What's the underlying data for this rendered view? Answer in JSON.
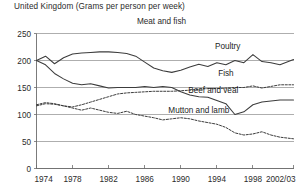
{
  "header": {
    "note": "United Kingdom (Grams per person per week)"
  },
  "chart_data": {
    "type": "line",
    "title": "Meat and fish",
    "subtitle": "United Kingdom (Grams per person per week)",
    "xlabel": "",
    "ylabel": "",
    "ylim": [
      0,
      250
    ],
    "yticks": [
      0,
      50,
      100,
      150,
      200,
      250
    ],
    "ytick_labels": [
      "0",
      "50",
      "100",
      "150",
      "200",
      "250"
    ],
    "xlim": [
      1974,
      2002.5
    ],
    "xticks": [
      1974,
      1978,
      1982,
      1986,
      1990,
      1994,
      1998,
      2002.5
    ],
    "xtick_labels": [
      "1974",
      "1978",
      "1982",
      "1986",
      "1990",
      "1994",
      "1998",
      "2002/03"
    ],
    "grid": true,
    "legend": "inline-labels",
    "x": [
      1974,
      1975,
      1976,
      1977,
      1978,
      1979,
      1980,
      1981,
      1982,
      1983,
      1984,
      1985,
      1986,
      1987,
      1988,
      1989,
      1990,
      1991,
      1992,
      1993,
      1994,
      1995,
      1996,
      1997,
      1998,
      1999,
      2000,
      2001,
      2002.5
    ],
    "series": [
      {
        "name": "Poultry",
        "style": "solid",
        "color": "#3c3c3c",
        "label_x": 1995.2,
        "label_y": 222,
        "values": [
          200,
          208,
          194,
          205,
          212,
          214,
          215,
          216,
          216,
          215,
          213,
          208,
          197,
          186,
          181,
          178,
          182,
          188,
          193,
          189,
          196,
          192,
          200,
          196,
          211,
          198,
          196,
          192,
          202
        ]
      },
      {
        "name": "Fish",
        "style": "dotted",
        "color": "#3c3c3c",
        "label_x": 1995.0,
        "label_y": 172,
        "values": [
          116,
          120,
          119,
          116,
          114,
          118,
          123,
          128,
          133,
          138,
          140,
          141,
          142,
          143,
          143,
          143,
          144,
          145,
          147,
          148,
          148,
          149,
          150,
          150,
          153,
          149,
          152,
          155,
          155
        ]
      },
      {
        "name": "Beef and veal",
        "style": "solid",
        "color": "#3c3c3c",
        "label_x": 1993.6,
        "label_y": 140,
        "values": [
          200,
          192,
          176,
          166,
          158,
          155,
          157,
          153,
          149,
          150,
          150,
          150,
          152,
          150,
          152,
          150,
          142,
          136,
          133,
          132,
          126,
          120,
          100,
          105,
          118,
          123,
          125,
          127,
          127
        ]
      },
      {
        "name": "Mutton and lamb",
        "style": "dotted",
        "color": "#3c3c3c",
        "label_x": 1992.0,
        "label_y": 102,
        "values": [
          118,
          122,
          120,
          116,
          112,
          108,
          112,
          108,
          104,
          102,
          106,
          100,
          97,
          94,
          90,
          92,
          94,
          92,
          88,
          85,
          82,
          76,
          66,
          62,
          64,
          68,
          62,
          58,
          55
        ]
      }
    ]
  }
}
